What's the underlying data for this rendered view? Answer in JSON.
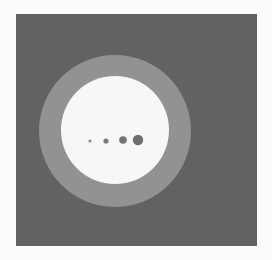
{
  "figure": {
    "canvas": {
      "width": 272,
      "height": 260,
      "background": "#fbfbfb"
    },
    "panel": {
      "x": 16,
      "y": 14,
      "width": 241,
      "height": 232,
      "color": "#626262"
    },
    "outer_ring": {
      "cx": 115,
      "cy": 131,
      "r": 76,
      "color": "#929292"
    },
    "inner_disc": {
      "cx": 115,
      "cy": 130,
      "r": 54,
      "color": "#f7f7f7"
    },
    "dots": [
      {
        "cx": 90,
        "cy": 141,
        "r": 1.6,
        "color": "#8a8a8a"
      },
      {
        "cx": 106,
        "cy": 141,
        "r": 2.6,
        "color": "#7a7a7a"
      },
      {
        "cx": 123,
        "cy": 140,
        "r": 3.8,
        "color": "#747474"
      },
      {
        "cx": 138,
        "cy": 140,
        "r": 5.2,
        "color": "#6e6e6e"
      }
    ]
  }
}
